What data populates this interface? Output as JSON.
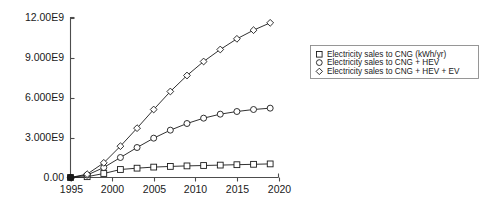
{
  "chart_data": {
    "type": "line",
    "title": "",
    "xlabel": "",
    "ylabel": "",
    "xlim": [
      1995,
      2020
    ],
    "ylim": [
      0,
      12000000000
    ],
    "grid": false,
    "legend_position": "right",
    "x": [
      1995,
      1997,
      1999,
      2001,
      2003,
      2005,
      2007,
      2009,
      2011,
      2013,
      2015,
      2017,
      2019
    ],
    "xticks": [
      1995,
      2000,
      2005,
      2010,
      2015,
      2020
    ],
    "xticklabels": [
      "1995",
      "2000",
      "2005",
      "2010",
      "2015",
      "2020"
    ],
    "yticks": [
      0,
      3000000000,
      6000000000,
      9000000000,
      12000000000
    ],
    "yticklabels": [
      "0.00",
      "3.000E9",
      "6.000E9",
      "9.000E9",
      "12.00E9"
    ],
    "series": [
      {
        "name": "Electricity sales to CNG (kWh/yr)",
        "marker": "square",
        "values": [
          0,
          60000000,
          300000000,
          600000000,
          700000000,
          780000000,
          830000000,
          870000000,
          900000000,
          930000000,
          960000000,
          990000000,
          1020000000
        ]
      },
      {
        "name": "Electricity sales to CNG + HEV",
        "marker": "circle",
        "values": [
          0,
          180000000,
          750000000,
          1500000000,
          2250000000,
          2950000000,
          3550000000,
          4050000000,
          4450000000,
          4750000000,
          4950000000,
          5100000000,
          5200000000
        ]
      },
      {
        "name": "Electricity sales to CNG + HEV + EV",
        "marker": "diamond",
        "values": [
          0,
          250000000,
          1100000000,
          2350000000,
          3700000000,
          5100000000,
          6450000000,
          7650000000,
          8700000000,
          9600000000,
          10400000000,
          11050000000,
          11600000000
        ]
      }
    ]
  },
  "legend": {
    "items": [
      {
        "label": "Electricity sales to CNG (kWh/yr)",
        "marker": "square-marker"
      },
      {
        "label": "Electricity sales to CNG + HEV",
        "marker": "circle-marker"
      },
      {
        "label": "Electricity sales to CNG + HEV + EV",
        "marker": "diamond-marker"
      }
    ]
  },
  "colors": {
    "line": "#1a1a1a",
    "axis": "#4d4d4d",
    "legend_border": "#8c8c8c",
    "background": "#ffffff"
  }
}
